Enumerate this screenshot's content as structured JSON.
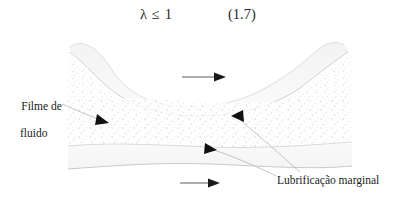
{
  "equation": {
    "expression": "λ  ≤  1",
    "number": "(1.7)"
  },
  "figure": {
    "labels": {
      "fluid_film_line1": "Filme de",
      "fluid_film_line2": "fluido",
      "boundary_lubrication": "Lubrificação marginal"
    },
    "colors": {
      "ink": "#1a1a1a",
      "leader_line": "#b9b9b9",
      "surface_outline": "#cfcfcf",
      "stipple": "#e2e2e2",
      "background": "#ffffff"
    },
    "annotations": {
      "flow_arrow_top": "flow-direction-arrow",
      "flow_arrow_bottom": "flow-direction-arrow"
    }
  }
}
